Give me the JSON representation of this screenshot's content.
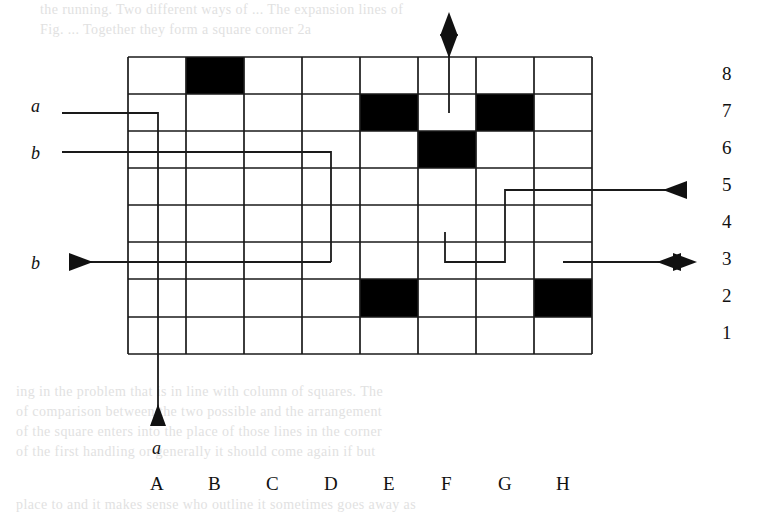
{
  "figure": {
    "type": "grid-callout-diagram",
    "grid": {
      "columns": [
        "A",
        "B",
        "C",
        "D",
        "E",
        "F",
        "G",
        "H"
      ],
      "rows": [
        "8",
        "7",
        "6",
        "5",
        "4",
        "3",
        "2",
        "1"
      ],
      "filled_cells": [
        "B8",
        "E7",
        "G7",
        "F6",
        "E2",
        "H2"
      ],
      "fill_color": "#000000",
      "line_color": "#1a1a1a",
      "background_color": "#ffffff"
    },
    "callouts": [
      {
        "id": "callout-a-left",
        "label": "a",
        "side": "left",
        "target_row": "7"
      },
      {
        "id": "callout-b-upper-left",
        "label": "b",
        "side": "left",
        "target_row": "6"
      },
      {
        "id": "callout-b-lower-left",
        "label": "b",
        "side": "left",
        "target_row": "3",
        "arrow": "right"
      },
      {
        "id": "callout-a-bottom",
        "label": "a",
        "side": "bottom",
        "target_column": "B",
        "arrow": "up"
      },
      {
        "id": "callout-top",
        "label": "",
        "side": "top",
        "target_column": "F",
        "arrow": "double-vertical"
      },
      {
        "id": "callout-right-row5",
        "label": "",
        "side": "right",
        "target_row": "5",
        "arrow": "left"
      },
      {
        "id": "callout-right-row3",
        "label": "",
        "side": "right",
        "target_row": "3",
        "arrow": "double-horizontal"
      }
    ]
  },
  "page_text": {
    "top_lines": [
      "the running.  Two different ways  of  ...  The expansion lines of",
      "Fig.    ...  Together  they  form a square corner  2a"
    ],
    "bottom_lines": [
      "ing  in  the   problem   that   is   in  line   with   column   of   squares.   The",
      "of   comparison  between   the   two  possible  and  the   arrangement",
      "of   the   square  enters  into  the   place   of   those   lines   in   the   corner",
      "of  the   first  handling  or  generally   it   should  come  again  if  but",
      "place  to  and  it  makes  sense  who  outline  it  sometimes  goes  away  as"
    ]
  },
  "colors": {
    "ink": "#111111",
    "fill": "#000000",
    "paper": "#ffffff",
    "faint_text": "#c9c9c9"
  }
}
